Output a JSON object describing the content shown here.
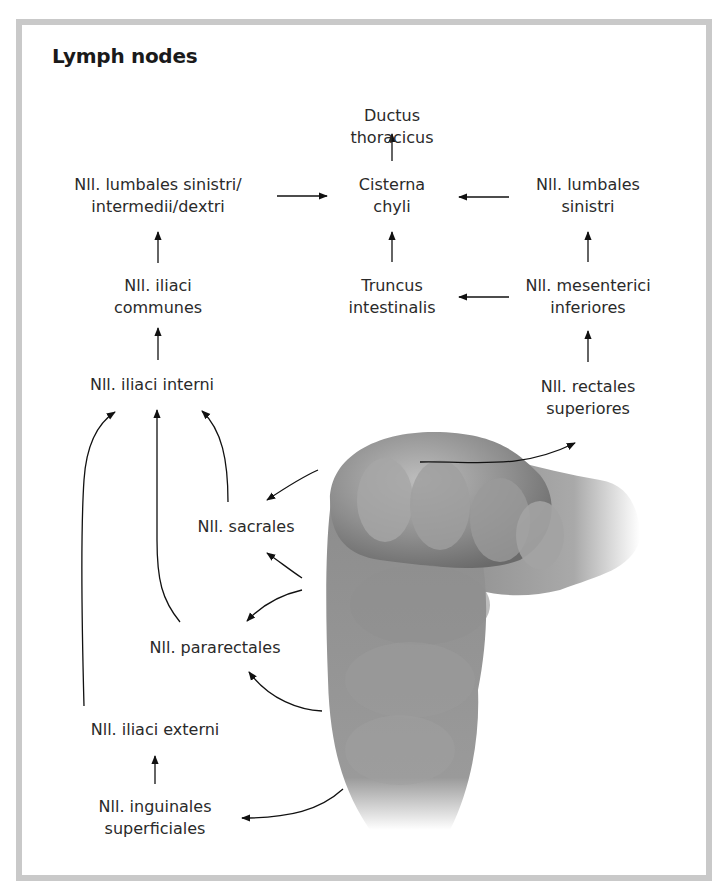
{
  "title": "Lymph nodes",
  "nodes": {
    "ductus_thoracicus": [
      "Ductus",
      "thoracicus"
    ],
    "cisterna_chyli": [
      "Cisterna",
      "chyli"
    ],
    "lumbales_all": [
      "Nll. lumbales sinistri/",
      "intermedii/dextri"
    ],
    "lumbales_sinistri": [
      "Nll. lumbales",
      "sinistri"
    ],
    "iliaci_communes": [
      "Nll. iliaci",
      "communes"
    ],
    "truncus_intestinalis": [
      "Truncus",
      "intestinalis"
    ],
    "mesenterici_inferiores": [
      "Nll. mesenterici",
      "inferiores"
    ],
    "iliaci_interni": [
      "Nll. iliaci interni"
    ],
    "rectales_superiores": [
      "Nll. rectales",
      "superiores"
    ],
    "sacrales": [
      "Nll. sacrales"
    ],
    "pararectales": [
      "Nll. pararectales"
    ],
    "iliaci_externi": [
      "Nll. iliaci externi"
    ],
    "inguinales_superficiales": [
      "Nll. inguinales",
      "superficiales"
    ]
  },
  "edges": [
    {
      "from": "cisterna_chyli",
      "to": "ductus_thoracicus"
    },
    {
      "from": "lumbales_all",
      "to": "cisterna_chyli"
    },
    {
      "from": "lumbales_sinistri",
      "to": "cisterna_chyli"
    },
    {
      "from": "iliaci_communes",
      "to": "lumbales_all"
    },
    {
      "from": "truncus_intestinalis",
      "to": "cisterna_chyli"
    },
    {
      "from": "mesenterici_inferiores",
      "to": "truncus_intestinalis"
    },
    {
      "from": "mesenterici_inferiores",
      "to": "lumbales_sinistri"
    },
    {
      "from": "iliaci_interni",
      "to": "iliaci_communes"
    },
    {
      "from": "rectales_superiores",
      "to": "mesenterici_inferiores"
    },
    {
      "from": "rectum",
      "to": "rectales_superiores"
    },
    {
      "from": "rectum",
      "to": "sacrales"
    },
    {
      "from": "rectum",
      "to": "pararectales"
    },
    {
      "from": "rectum",
      "to": "inguinales_superficiales"
    },
    {
      "from": "sacrales",
      "to": "iliaci_interni"
    },
    {
      "from": "pararectales",
      "to": "iliaci_interni"
    },
    {
      "from": "iliaci_externi",
      "to": "iliaci_interni"
    },
    {
      "from": "inguinales_superficiales",
      "to": "iliaci_externi"
    }
  ],
  "illustration": "rectum"
}
